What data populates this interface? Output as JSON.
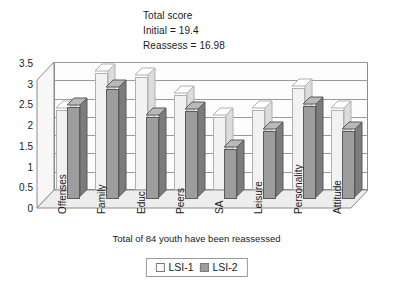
{
  "heading": {
    "line1": "Total score",
    "line2": "Initial = 19.4",
    "line3": "Reassess = 16.98"
  },
  "caption": "Total of  84 youth have been reassessed",
  "legend": {
    "items": [
      {
        "label": "LSI-1",
        "color": "#fbfbfb"
      },
      {
        "label": "LSI-2",
        "color": "#9d9d9d"
      }
    ]
  },
  "chart_data": {
    "type": "bar",
    "title": "Total score",
    "subtitle": "Initial = 19.4 / Reassess = 16.98",
    "xlabel": "Total of  84 youth have been reassessed",
    "ylabel": "",
    "ylim": [
      0,
      3.5
    ],
    "yticks": [
      "0",
      "0.5",
      "1",
      "1.5",
      "2",
      "2.5",
      "3",
      "3.5"
    ],
    "ytick_values": [
      0,
      0.5,
      1,
      1.5,
      2,
      2.5,
      3,
      3.5
    ],
    "grid": true,
    "legend_position": "bottom",
    "categories": [
      "Offenses",
      "Family",
      "Educ",
      "Peers",
      "SA",
      "Leisure",
      "Personality",
      "Attitude"
    ],
    "series": [
      {
        "name": "LSI-1",
        "color": "#f2f2f2",
        "values": [
          2.2,
          3.2,
          3.1,
          2.6,
          2.0,
          2.2,
          2.8,
          2.2
        ]
      },
      {
        "name": "LSI-2",
        "color": "#9d9d9d",
        "values": [
          2.5,
          3.0,
          2.25,
          2.4,
          1.35,
          1.85,
          2.55,
          1.85
        ]
      }
    ]
  }
}
